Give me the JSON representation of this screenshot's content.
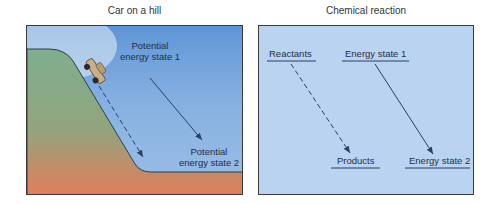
{
  "left_panel": {
    "title": "Car on a hill",
    "state1_line1": "Potential",
    "state1_line2": "energy state 1",
    "state2_line1": "Potential",
    "state2_line2": "energy state 2"
  },
  "right_panel": {
    "title": "Chemical reaction",
    "reactants": "Reactants",
    "products": "Products",
    "energy_state_1": "Energy state 1",
    "energy_state_2": "Energy state 2"
  },
  "colors": {
    "sky_top": "#5b93d6",
    "sky_bottom": "#dbe9f5",
    "hill_top": "#7fae8e",
    "hill_bottom": "#e37d59",
    "reaction_bg": "#b9d3f0",
    "line": "#2a3f63"
  }
}
